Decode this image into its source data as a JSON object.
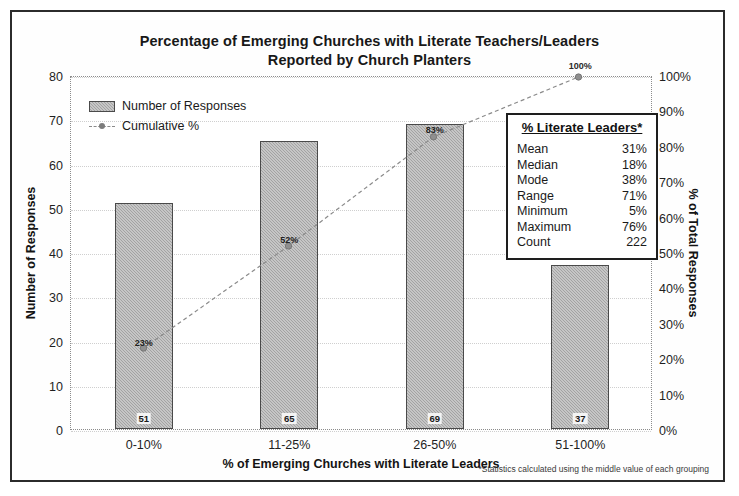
{
  "chart_data": {
    "type": "bar",
    "title": "Percentage of Emerging Churches with Literate Teachers/Leaders Reported by Church Planters",
    "title_line1": "Percentage of Emerging Churches with Literate Teachers/Leaders",
    "title_line2": "Reported by Church Planters",
    "xlabel": "% of Emerging Churches with Literate Leaders",
    "ylabel": "Number of Responses",
    "y2label": "% of Total Responses",
    "categories": [
      "0-10%",
      "11-25%",
      "26-50%",
      "51-100%"
    ],
    "ylim": [
      0,
      80
    ],
    "y2lim": [
      0,
      100
    ],
    "yticks": [
      "80",
      "70",
      "60",
      "50",
      "40",
      "30",
      "20",
      "10",
      "0"
    ],
    "ytick_values": [
      80,
      70,
      60,
      50,
      40,
      30,
      20,
      10,
      0
    ],
    "y2ticks": [
      "100%",
      "90%",
      "80%",
      "70%",
      "60%",
      "50%",
      "40%",
      "30%",
      "20%",
      "10%",
      "0%"
    ],
    "y2tick_values": [
      100,
      90,
      80,
      70,
      60,
      50,
      40,
      30,
      20,
      10,
      0
    ],
    "grid": true,
    "legend_position": "top-left",
    "series": [
      {
        "name": "Number of Responses",
        "type": "bar",
        "axis": "left",
        "values": [
          51,
          65,
          69,
          37
        ],
        "labels": [
          "51",
          "65",
          "69",
          "37"
        ],
        "color": "#a3a3a3"
      },
      {
        "name": "Cumulative %",
        "type": "line",
        "axis": "right",
        "values": [
          23,
          52,
          83,
          100
        ],
        "labels": [
          "23%",
          "52%",
          "83%",
          "100%"
        ],
        "color": "#8a8a8a"
      }
    ]
  },
  "legend": {
    "items": [
      {
        "label": "Number of Responses",
        "marker": "bar-swatch"
      },
      {
        "label": "Cumulative %",
        "marker": "dashed-line-marker"
      }
    ]
  },
  "stats_box": {
    "title": "% Literate Leaders*",
    "rows": [
      {
        "label": "Mean",
        "value": "31%"
      },
      {
        "label": "Median",
        "value": "18%"
      },
      {
        "label": "Mode",
        "value": "38%"
      },
      {
        "label": "Range",
        "value": "71%"
      },
      {
        "label": "Minimum",
        "value": "5%"
      },
      {
        "label": "Maximum",
        "value": "76%"
      },
      {
        "label": "Count",
        "value": "222"
      }
    ]
  },
  "footnote": "*Statistics calculated using the middle value of each grouping"
}
